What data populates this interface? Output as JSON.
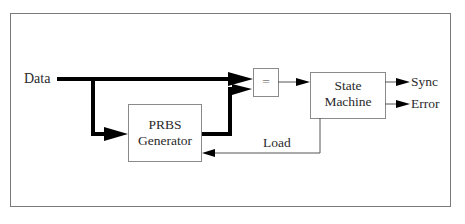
{
  "diagram": {
    "inputs": {
      "data_label": "Data"
    },
    "blocks": {
      "comparator": {
        "label": "="
      },
      "prbs": {
        "line1": "PRBS",
        "line2": "Generator"
      },
      "state_machine": {
        "line1": "State",
        "line2": "Machine"
      }
    },
    "outputs": {
      "sync_label": "Sync",
      "error_label": "Error"
    },
    "signals": {
      "load_label": "Load"
    },
    "colors": {
      "frame": "#7a7a7a",
      "box": "#8a8a8a",
      "bus": "#000000",
      "wire": "#555555",
      "text": "#2a2a2a"
    }
  }
}
